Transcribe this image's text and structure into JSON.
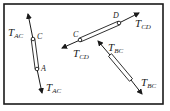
{
  "diagram": {
    "type": "free-body-diagram",
    "frame": {
      "x": 4,
      "y": 4,
      "width": 159,
      "height": 100,
      "stroke": "#1a1a1a"
    },
    "members": [
      {
        "name": "member-AC",
        "pins": [
          {
            "label": "C",
            "x": 33,
            "y": 39
          },
          {
            "label": "A",
            "x": 37,
            "y": 69
          }
        ],
        "arrow_top": {
          "x": 28,
          "y": 15
        },
        "arrow_bottom": {
          "x": 42,
          "y": 92
        },
        "force_labels": [
          {
            "main": "T",
            "sub": "AC",
            "x": 8,
            "y": 33
          },
          {
            "main": "T",
            "sub": "AC",
            "x": 46,
            "y": 92
          }
        ]
      },
      {
        "name": "member-CD",
        "pins": [
          {
            "label": "C",
            "x": 80,
            "y": 40
          },
          {
            "label": "D",
            "x": 119,
            "y": 23
          }
        ],
        "arrow_left": {
          "x": 62,
          "y": 48
        },
        "arrow_right": {
          "x": 138,
          "y": 14
        },
        "force_labels": [
          {
            "main": "T",
            "sub": "CD",
            "x": 134,
            "y": 25
          },
          {
            "main": "T",
            "sub": "CD",
            "x": 73,
            "y": 58
          }
        ]
      },
      {
        "name": "member-BC",
        "arrow_top": {
          "x": 99,
          "y": 42
        },
        "arrow_bottom": {
          "x": 141,
          "y": 93
        },
        "force_labels": [
          {
            "main": "T",
            "sub": "BC",
            "x": 108,
            "y": 49
          },
          {
            "main": "T",
            "sub": "BC",
            "x": 142,
            "y": 86
          }
        ]
      }
    ],
    "colors": {
      "ink": "#1a1a1a",
      "background": "#ffffff"
    }
  },
  "labels": {
    "tac_top_main": "T",
    "tac_top_sub": "AC",
    "tac_bot_main": "T",
    "tac_bot_sub": "AC",
    "pin_c_left": "C",
    "pin_a": "A",
    "tcd_right_main": "T",
    "tcd_right_sub": "CD",
    "tcd_left_main": "T",
    "tcd_left_sub": "CD",
    "pin_c_mid": "C",
    "pin_d": "D",
    "tbc_top_main": "T",
    "tbc_top_sub": "BC",
    "tbc_bot_main": "T",
    "tbc_bot_sub": "BC"
  }
}
